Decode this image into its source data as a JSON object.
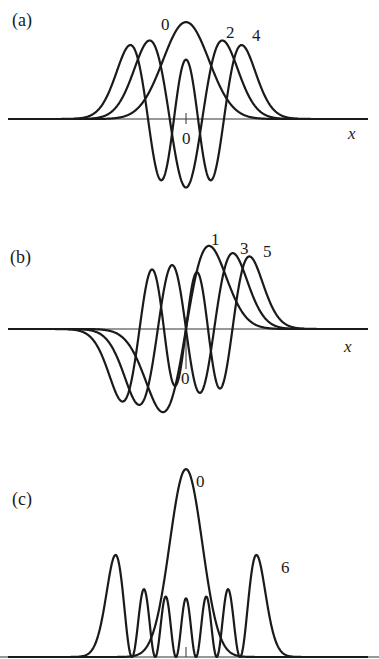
{
  "chart_data": [
    {
      "type": "line",
      "panel": "(a)",
      "title": "",
      "description": "Even harmonic-oscillator wavefunctions psi_n(x)",
      "xlabel": "x",
      "ylabel": "",
      "origin_label": "0",
      "grid": false,
      "legend": "inline curve labels",
      "series": [
        {
          "name": "0",
          "n": 0,
          "peak_value": 0.751
        },
        {
          "name": "2",
          "n": 2,
          "value_at_origin": -0.531
        },
        {
          "name": "4",
          "n": 4,
          "value_at_origin": 0.46
        }
      ],
      "xlim": [
        -7.6,
        7.8
      ]
    },
    {
      "type": "line",
      "panel": "(b)",
      "title": "",
      "description": "Odd harmonic-oscillator wavefunctions psi_n(x)",
      "xlabel": "x",
      "ylabel": "",
      "origin_label": "0",
      "grid": false,
      "legend": "inline curve labels",
      "series": [
        {
          "name": "1",
          "n": 1,
          "peak_value": 0.643
        },
        {
          "name": "3",
          "n": 3
        },
        {
          "name": "5",
          "n": 5
        }
      ],
      "xlim": [
        -7.6,
        7.8
      ]
    },
    {
      "type": "line",
      "panel": "(c)",
      "title": "",
      "description": "Probability densities |psi_n(x)|^2",
      "xlabel": "",
      "ylabel": "",
      "grid": false,
      "legend": "inline curve labels",
      "series": [
        {
          "name": "0",
          "n": 0,
          "peak_value": 0.564
        },
        {
          "name": "6",
          "n": 6,
          "outer_peak_value": 0.3
        }
      ],
      "xlim": [
        -7.6,
        7.8
      ]
    }
  ],
  "panels": {
    "a": {
      "label": "(a)",
      "curve_labels": [
        "0",
        "2",
        "4"
      ],
      "axis_label": "x",
      "origin_label": "0"
    },
    "b": {
      "label": "(b)",
      "curve_labels": [
        "1",
        "3",
        "5"
      ],
      "axis_label": "x",
      "origin_label": "0"
    },
    "c": {
      "label": "(c)",
      "curve_labels": [
        "0",
        "6"
      ]
    }
  },
  "style": {
    "line_color": "#1a1a1a",
    "axis_color": "#333333"
  }
}
